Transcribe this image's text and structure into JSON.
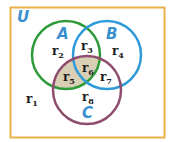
{
  "diagram": {
    "type": "venn",
    "universe": {
      "label": "U",
      "border_color": "#e8b24a",
      "label_color": "#3a8fd0"
    },
    "sets": [
      {
        "name": "A",
        "label": "A",
        "color": "#2e9a3a",
        "label_color": "#3a8fd0"
      },
      {
        "name": "B",
        "label": "B",
        "color": "#2f9ad8",
        "label_color": "#3a8fd0"
      },
      {
        "name": "C",
        "label": "C",
        "color": "#8e4d6e",
        "label_color": "#3a8fd0"
      }
    ],
    "shaded": {
      "regions": [
        "r5",
        "r6"
      ],
      "description": "A ∩ C",
      "color": "#d9cfb5"
    },
    "regions": [
      {
        "id": "r1",
        "base": "r",
        "sub": "1",
        "membership": "outside A, B, C"
      },
      {
        "id": "r2",
        "base": "r",
        "sub": "2",
        "membership": "A only"
      },
      {
        "id": "r3",
        "base": "r",
        "sub": "3",
        "membership": "A ∩ B only"
      },
      {
        "id": "r4",
        "base": "r",
        "sub": "4",
        "membership": "B only"
      },
      {
        "id": "r5",
        "base": "r",
        "sub": "5",
        "membership": "A ∩ C only"
      },
      {
        "id": "r6",
        "base": "r",
        "sub": "6",
        "membership": "A ∩ B ∩ C"
      },
      {
        "id": "r7",
        "base": "r",
        "sub": "7",
        "membership": "B ∩ C only"
      },
      {
        "id": "r8",
        "base": "r",
        "sub": "8",
        "membership": "C only"
      }
    ]
  }
}
